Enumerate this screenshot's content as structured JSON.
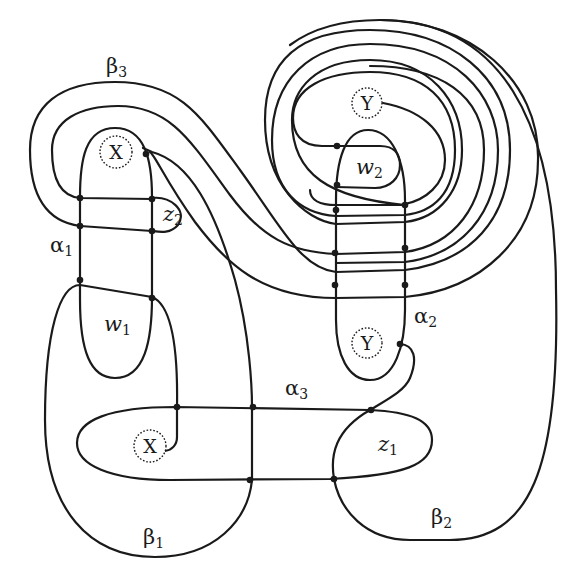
{
  "diagram": {
    "type": "heegaard-diagram",
    "colors": {
      "stroke": "#1a1a1a",
      "background": "#ffffff"
    },
    "labels": {
      "beta3": {
        "base": "β",
        "sub": "3"
      },
      "beta1": {
        "base": "β",
        "sub": "1"
      },
      "beta2": {
        "base": "β",
        "sub": "2"
      },
      "alpha1": {
        "base": "α",
        "sub": "1"
      },
      "alpha2": {
        "base": "α",
        "sub": "2"
      },
      "alpha3": {
        "base": "α",
        "sub": "3"
      },
      "w1": {
        "base": "w",
        "sub": "1"
      },
      "w2": {
        "base": "w",
        "sub": "2"
      },
      "z1": {
        "base": "z",
        "sub": "1"
      },
      "z2": {
        "base": "z",
        "sub": "2"
      }
    },
    "basepoints": [
      {
        "id": "X-top",
        "text": "X"
      },
      {
        "id": "X-bottom",
        "text": "X"
      },
      {
        "id": "Y-top",
        "text": "Y"
      },
      {
        "id": "Y-bottom",
        "text": "Y"
      }
    ]
  }
}
